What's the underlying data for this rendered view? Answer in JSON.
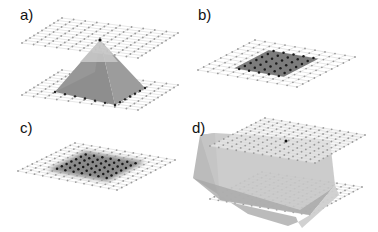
{
  "panels": [
    {
      "id": "a",
      "label": "a)",
      "description": "pyramid between two planes with apex touching top plane"
    },
    {
      "id": "b",
      "label": "b)",
      "description": "single plane with dark filled rectangular region"
    },
    {
      "id": "c",
      "label": "c)",
      "description": "single plane with dark region blurred edges"
    },
    {
      "id": "d",
      "label": "d)",
      "description": "prism solid between two planes with apex on top plane"
    }
  ],
  "colors": {
    "grid_line": "#d0d0d0",
    "grid_dot": "#9a9a9a",
    "dark_dot": "#1a1a1a",
    "pyramid_dark": "#8a8a8a",
    "pyramid_light": "#c4c4c4",
    "region_fill": "#7a7a7a",
    "solid_fill": "#c8c8c8",
    "solid_dark": "#a8a8a8"
  }
}
